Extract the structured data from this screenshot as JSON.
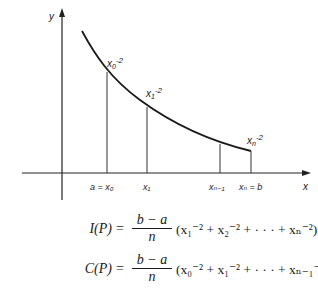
{
  "diagram": {
    "axes": {
      "x_label": "x",
      "y_label": "y"
    },
    "curve_labels": {
      "x0": {
        "base": "x",
        "sub": "0",
        "exp": "-2"
      },
      "x1": {
        "base": "x",
        "sub": "1",
        "exp": "-2"
      },
      "xn": {
        "base": "x",
        "sub": "n",
        "exp": "-2"
      }
    },
    "tick_labels": {
      "a_x0": "a = x₀",
      "x1": "x₁",
      "xn_minus_1": "xₙ₋₁",
      "xn_b": "xₙ = b"
    }
  },
  "equations": [
    {
      "lhs": "I(P)",
      "eq": "=",
      "numerator": "b − a",
      "denominator": "n",
      "rhs": "(x₁⁻² + x₂⁻² + · · · + xₙ⁻²),"
    },
    {
      "lhs": "C(P)",
      "eq": "=",
      "numerator": "b − a",
      "denominator": "n",
      "rhs": "(x₀⁻² + x₁⁻² + · · · + xₙ₋₁⁻²)."
    }
  ]
}
